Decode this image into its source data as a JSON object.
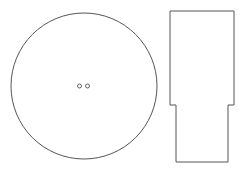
{
  "diagram": {
    "background": "#ffffff",
    "stroke_color": "#555555",
    "elements": [
      {
        "name": "disc-outline",
        "type": "circle",
        "cx": 84,
        "cy": 86,
        "r": 73
      },
      {
        "name": "hole-left",
        "type": "circle",
        "cx": 79.5,
        "cy": 86,
        "r": 2
      },
      {
        "name": "hole-right",
        "type": "circle",
        "cx": 87.5,
        "cy": 86,
        "r": 2
      },
      {
        "name": "stepped-profile",
        "type": "polygon",
        "points": "170,11 234,11 234,105 228,105 228,108 228,162 176,162 176,108 176,105 170,105"
      }
    ]
  }
}
